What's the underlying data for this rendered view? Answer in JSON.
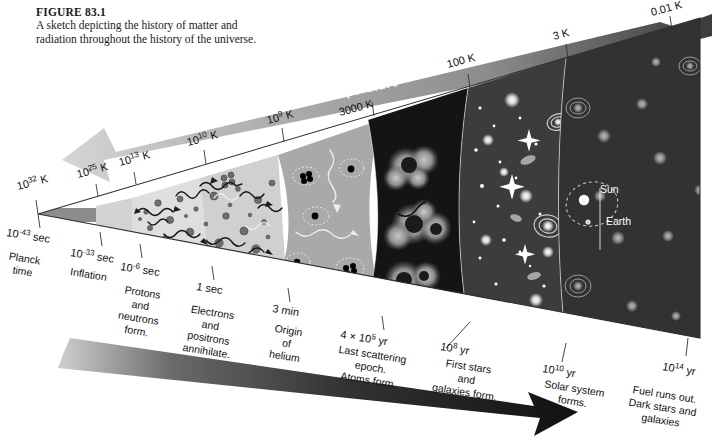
{
  "figure": {
    "number": "FIGURE 83.1",
    "caption": "A sketch depicting the history of matter and radiation throughout the history of the universe."
  },
  "axes": {
    "temperature_label": "Temperature",
    "time_label": "Time",
    "temperature_arrow_direction": "left",
    "time_arrow_direction": "right",
    "temperature_band_color": "#9a9a9a",
    "time_band_color": "#2c2c2c"
  },
  "temperature_ticks": [
    {
      "value": "10",
      "exp": "32",
      "unit": " K"
    },
    {
      "value": "10",
      "exp": "25",
      "unit": " K"
    },
    {
      "value": "10",
      "exp": "13",
      "unit": " K"
    },
    {
      "value": "10",
      "exp": "10",
      "unit": " K"
    },
    {
      "value": "10",
      "exp": "9",
      "unit": " K"
    },
    {
      "value": "3000",
      "exp": "",
      "unit": " K"
    },
    {
      "value": "100",
      "exp": "",
      "unit": " K"
    },
    {
      "value": "3",
      "exp": "",
      "unit": " K"
    },
    {
      "value": "0.01",
      "exp": "",
      "unit": " K"
    }
  ],
  "time_ticks": [
    {
      "value": "10",
      "exp": "-43",
      "unit": " sec"
    },
    {
      "value": "10",
      "exp": "-33",
      "unit": " sec"
    },
    {
      "value": "10",
      "exp": "-6",
      "unit": " sec"
    },
    {
      "value": "1",
      "exp": "",
      "unit": " sec"
    },
    {
      "value": "3",
      "exp": "",
      "unit": " min"
    },
    {
      "value": "4 × 10",
      "exp": "5",
      "unit": " yr"
    },
    {
      "value": "10",
      "exp": "8",
      "unit": " yr"
    },
    {
      "value": "10",
      "exp": "10",
      "unit": " yr"
    },
    {
      "value": "10",
      "exp": "14",
      "unit": " yr"
    }
  ],
  "events": [
    {
      "lines": [
        "Planck",
        "time"
      ]
    },
    {
      "lines": [
        "Inflation"
      ]
    },
    {
      "lines": [
        "Protons",
        "and",
        "neutrons",
        "form."
      ]
    },
    {
      "lines": [
        "Electrons",
        "and",
        "positrons",
        "annihilate."
      ]
    },
    {
      "lines": [
        "Origin",
        "of",
        "helium"
      ]
    },
    {
      "lines": [
        "Last scattering",
        "epoch.",
        "Atoms form."
      ]
    },
    {
      "lines": [
        "First stars",
        "and",
        "galaxies form."
      ]
    },
    {
      "lines": [
        "Solar system",
        "forms."
      ]
    },
    {
      "lines": [
        "Fuel runs out.",
        "Dark stars and",
        "galaxies"
      ]
    }
  ],
  "sky_labels": [
    {
      "name": "Sun"
    },
    {
      "name": "Earth"
    }
  ],
  "eras": [
    {
      "name": "quantum-gravity-era",
      "fill": "#8d8d8d"
    },
    {
      "name": "inflation-era",
      "fill": "#d3d3d3"
    },
    {
      "name": "quark-era",
      "fill": "#dcdcdc"
    },
    {
      "name": "lepton-era",
      "fill": "#cfcfcf"
    },
    {
      "name": "nucleosynthesis-era",
      "fill": "#a8a8a8"
    },
    {
      "name": "last-scattering-era",
      "fill": "#171717"
    },
    {
      "name": "first-stars-era",
      "fill": "#3a3a3a"
    },
    {
      "name": "solar-system-era",
      "fill": "#343434"
    },
    {
      "name": "dark-era",
      "fill": "#262626"
    }
  ]
}
